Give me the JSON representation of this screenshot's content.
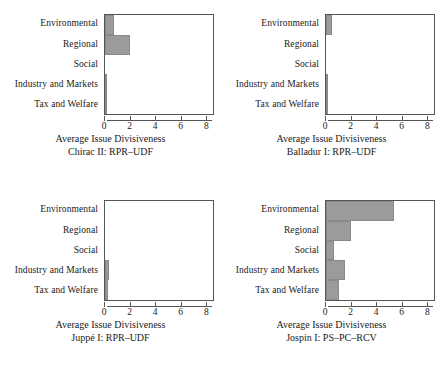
{
  "figure": {
    "panel_count": 4,
    "bar_color": "#9b9b9b",
    "axis_color": "#555555",
    "background": "#ffffff"
  },
  "chart_data": [
    {
      "type": "bar",
      "orientation": "horizontal",
      "title": "",
      "xlabel": "Average Issue Divisiveness",
      "subtitle": "Chirac II: RPR–UDF",
      "ylabel": "",
      "categories": [
        "Environmental",
        "Regional",
        "Social",
        "Industry and Markets",
        "Tax and Welfare"
      ],
      "values": [
        0.7,
        2.0,
        0.0,
        0.1,
        0.1
      ],
      "xlim": [
        0,
        8.6
      ],
      "xticks": [
        0,
        2,
        4,
        6,
        8
      ],
      "xticklabels": [
        "0",
        "2",
        "4",
        "6",
        "8"
      ],
      "grid": false,
      "legend": "none"
    },
    {
      "type": "bar",
      "orientation": "horizontal",
      "title": "",
      "xlabel": "Average Issue Divisiveness",
      "subtitle": "Balladur I: RPR–UDF",
      "ylabel": "",
      "categories": [
        "Environmental",
        "Regional",
        "Social",
        "Industry and Markets",
        "Tax and Welfare"
      ],
      "values": [
        0.5,
        0.0,
        0.0,
        0.12,
        0.12
      ],
      "xlim": [
        0,
        8.6
      ],
      "xticks": [
        0,
        2,
        4,
        6,
        8
      ],
      "xticklabels": [
        "0",
        "2",
        "4",
        "6",
        "8"
      ],
      "grid": false,
      "legend": "none"
    },
    {
      "type": "bar",
      "orientation": "horizontal",
      "title": "",
      "xlabel": "Average Issue Divisiveness",
      "subtitle": "Juppé I: RPR–UDF",
      "ylabel": "",
      "categories": [
        "Environmental",
        "Regional",
        "Social",
        "Industry and Markets",
        "Tax and Welfare"
      ],
      "values": [
        0.0,
        0.0,
        0.0,
        0.35,
        0.2
      ],
      "xlim": [
        0,
        8.6
      ],
      "xticks": [
        0,
        2,
        4,
        6,
        8
      ],
      "xticklabels": [
        "0",
        "2",
        "4",
        "6",
        "8"
      ],
      "grid": false,
      "legend": "none"
    },
    {
      "type": "bar",
      "orientation": "horizontal",
      "title": "",
      "xlabel": "Average Issue Divisiveness",
      "subtitle": "Jospin I: PS–PC–RCV",
      "ylabel": "",
      "categories": [
        "Environmental",
        "Regional",
        "Social",
        "Industry and Markets",
        "Tax and Welfare"
      ],
      "values": [
        5.4,
        2.0,
        0.6,
        1.5,
        1.0
      ],
      "xlim": [
        0,
        8.6
      ],
      "xticks": [
        0,
        2,
        4,
        6,
        8
      ],
      "xticklabels": [
        "0",
        "2",
        "4",
        "6",
        "8"
      ],
      "grid": false,
      "legend": "none"
    }
  ]
}
